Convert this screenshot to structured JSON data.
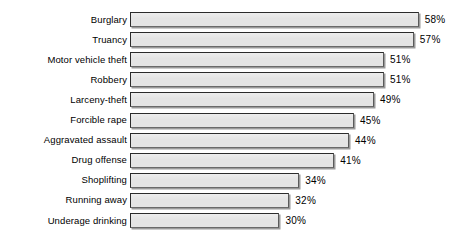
{
  "chart_data": {
    "type": "bar",
    "orientation": "horizontal",
    "title": "",
    "subtitle": "",
    "xlabel": "",
    "ylabel": "",
    "xlim": [
      0,
      58
    ],
    "grid": false,
    "legend": null,
    "value_suffix": "%",
    "categories": [
      "Burglary",
      "Truancy",
      "Motor vehicle theft",
      "Robbery",
      "Larceny-theft",
      "Forcible rape",
      "Aggravated assault",
      "Drug offense",
      "Shoplifting",
      "Running away",
      "Underage drinking"
    ],
    "values": [
      58,
      57,
      51,
      51,
      49,
      45,
      44,
      41,
      34,
      32,
      30
    ],
    "value_labels": [
      "58%",
      "57%",
      "51%",
      "51%",
      "49%",
      "45%",
      "44%",
      "41%",
      "34%",
      "32%",
      "30%"
    ],
    "colors": {
      "bar_fill": "#e4e4e4",
      "bar_border": "#2b2b2b",
      "bar_shadow": "#9a9a9a",
      "background": "#ffffff",
      "text": "#000000"
    }
  }
}
